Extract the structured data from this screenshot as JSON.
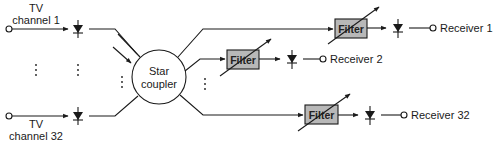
{
  "diagram": {
    "sources": [
      {
        "label_line1": "TV",
        "label_line2": "channel 1"
      },
      {
        "label_line1": "TV",
        "label_line2": "channel 32"
      }
    ],
    "coupler": {
      "label_line1": "Star",
      "label_line2": "coupler"
    },
    "filters": [
      {
        "label": "Filter"
      },
      {
        "label": "Filter"
      },
      {
        "label": "Filter"
      }
    ],
    "receivers": [
      {
        "label": "Receiver 1"
      },
      {
        "label": "Receiver 2"
      },
      {
        "label": "Receiver 32"
      }
    ],
    "colors": {
      "line": "#1a1a1a",
      "filter_fill": "#b8b8b8",
      "background": "#ffffff"
    }
  }
}
